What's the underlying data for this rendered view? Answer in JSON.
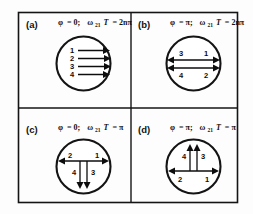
{
  "figure": {
    "background_color": "#fdfdfd",
    "ink_color": "#141414",
    "panels": [
      {
        "id": "a",
        "label": "(a)",
        "condition": "φ = 0;   ω₂₁T = 2nπ",
        "condition_parts": {
          "phi_symbol": "φ",
          "phi_value": "= 0;",
          "omega_symbol": "ω",
          "omega_subscript": "21",
          "period_symbol": "T",
          "period_value": "= 2nπ"
        },
        "arrow_pattern": "four-parallel-right",
        "arrow_labels": [
          "1",
          "2",
          "3",
          "4"
        ],
        "description": "Four parallel arrows pointing right, stacked vertically, labels 1 to 4 top to bottom"
      },
      {
        "id": "b",
        "label": "(b)",
        "condition": "φ = π;   ω₂₁T = 2nπ",
        "condition_parts": {
          "phi_symbol": "φ",
          "phi_value": "= π;",
          "omega_symbol": "ω",
          "omega_subscript": "21",
          "period_symbol": "T",
          "period_value": "= 2nπ"
        },
        "arrow_pattern": "two-horizontal-double",
        "arrow_labels": [
          "3",
          "1",
          "4",
          "2"
        ],
        "label_positions": {
          "upper_left": "3",
          "upper_right": "1",
          "lower_left": "4",
          "lower_right": "2"
        },
        "description": "Two horizontal double-headed arrows across the circle"
      },
      {
        "id": "c",
        "label": "(c)",
        "condition": "φ = 0;   ω₂₁T = π",
        "condition_parts": {
          "phi_symbol": "φ",
          "phi_value": "= 0;",
          "omega_symbol": "ω",
          "omega_subscript": "21",
          "period_symbol": "T",
          "period_value": "= π"
        },
        "arrow_pattern": "horizontal-double-plus-two-down",
        "arrow_labels": [
          "2",
          "1",
          "4",
          "3"
        ],
        "label_positions": {
          "horizontal_left": "2",
          "horizontal_right": "1",
          "vertical_left": "4",
          "vertical_right": "3"
        },
        "description": "Horizontal double-headed arrow with two downward arrows below"
      },
      {
        "id": "d",
        "label": "(d)",
        "condition": "φ = π;   ω₂₁T = π",
        "condition_parts": {
          "phi_symbol": "φ",
          "phi_value": "= π;",
          "omega_symbol": "ω",
          "omega_subscript": "21",
          "period_symbol": "T",
          "period_value": "= π"
        },
        "arrow_pattern": "horizontal-double-plus-two-up",
        "arrow_labels": [
          "4",
          "3",
          "2",
          "1"
        ],
        "label_positions": {
          "vertical_left": "4",
          "vertical_right": "3",
          "horizontal_left": "2",
          "horizontal_right": "1"
        },
        "description": "Two upward arrows above a horizontal double-headed arrow"
      }
    ]
  }
}
